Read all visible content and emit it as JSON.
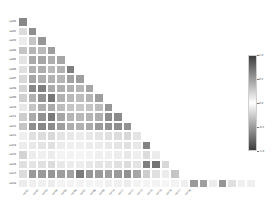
{
  "figure": {
    "background": "#ffffff",
    "plot_background": "#ffffff"
  },
  "chart_data": {
    "type": "heatmap",
    "title": "",
    "subtitle": "",
    "xlabel": "",
    "ylabel": "",
    "grid": false,
    "triangle": "lower",
    "legend_position": "right",
    "cmap": "gray-diverging",
    "vmin": -1.0,
    "vmax": 1.0,
    "colorbar": {
      "label": "",
      "orientation": "vertical",
      "ticks": [
        1.0,
        0.5,
        0.0,
        -0.5,
        -1.0
      ],
      "tick_labels": [
        "1.0",
        "0.5",
        "0.0",
        "-0.5",
        "-1.0"
      ],
      "low_color": "#3d3d3d",
      "mid_color": "#ffffff",
      "high_color": "#3d3d3d"
    },
    "categories": [
      "x01",
      "x02",
      "x03",
      "x04",
      "x05",
      "x06",
      "x07",
      "x08",
      "x09",
      "x10",
      "x11",
      "x12",
      "x13",
      "x14",
      "x15",
      "x16",
      "x17",
      "x18"
    ],
    "xtick_labels": [
      "var01",
      "var02",
      "var03",
      "var04",
      "var05",
      "var06",
      "var07",
      "var08",
      "var09",
      "var10",
      "var11",
      "var12",
      "var13",
      "var14",
      "var15",
      "var16",
      "var17",
      "var18"
    ],
    "ytick_labels": [
      "var01",
      "var02",
      "var03",
      "var04",
      "var05",
      "var06",
      "var07",
      "var08",
      "var09",
      "var10",
      "var11",
      "var12",
      "var13",
      "var14",
      "var15",
      "var16",
      "var17",
      "var18"
    ],
    "matrix": [
      [
        0.62,
        null,
        null,
        null,
        null,
        null,
        null,
        null,
        null,
        null,
        null,
        null,
        null,
        null,
        null,
        null,
        null,
        null
      ],
      [
        0.18,
        0.58,
        null,
        null,
        null,
        null,
        null,
        null,
        null,
        null,
        null,
        null,
        null,
        null,
        null,
        null,
        null,
        null
      ],
      [
        0.1,
        0.3,
        0.54,
        null,
        null,
        null,
        null,
        null,
        null,
        null,
        null,
        null,
        null,
        null,
        null,
        null,
        null,
        null
      ],
      [
        0.3,
        0.38,
        0.36,
        0.5,
        null,
        null,
        null,
        null,
        null,
        null,
        null,
        null,
        null,
        null,
        null,
        null,
        null,
        null
      ],
      [
        0.14,
        0.44,
        0.46,
        0.42,
        0.46,
        null,
        null,
        null,
        null,
        null,
        null,
        null,
        null,
        null,
        null,
        null,
        null,
        null
      ],
      [
        0.16,
        0.4,
        0.42,
        0.36,
        0.4,
        0.66,
        null,
        null,
        null,
        null,
        null,
        null,
        null,
        null,
        null,
        null,
        null,
        null
      ],
      [
        0.2,
        0.46,
        0.42,
        0.4,
        0.38,
        0.48,
        0.5,
        null,
        null,
        null,
        null,
        null,
        null,
        null,
        null,
        null,
        null,
        null
      ],
      [
        0.22,
        0.62,
        0.66,
        0.44,
        0.42,
        0.4,
        0.38,
        0.46,
        null,
        null,
        null,
        null,
        null,
        null,
        null,
        null,
        null,
        null
      ],
      [
        0.24,
        0.4,
        0.56,
        0.7,
        0.4,
        0.36,
        0.34,
        0.38,
        0.5,
        null,
        null,
        null,
        null,
        null,
        null,
        null,
        null,
        null
      ],
      [
        0.12,
        0.3,
        0.42,
        0.44,
        0.34,
        0.3,
        0.28,
        0.3,
        0.34,
        0.54,
        null,
        null,
        null,
        null,
        null,
        null,
        null,
        null
      ],
      [
        0.26,
        0.44,
        0.56,
        0.68,
        0.46,
        0.38,
        0.36,
        0.38,
        0.42,
        0.58,
        0.6,
        null,
        null,
        null,
        null,
        null,
        null,
        null
      ],
      [
        0.3,
        0.58,
        0.62,
        0.6,
        0.5,
        0.42,
        0.4,
        0.44,
        0.52,
        0.56,
        0.58,
        0.56,
        null,
        null,
        null,
        null,
        null,
        null
      ],
      [
        0.08,
        0.16,
        0.18,
        0.2,
        0.14,
        0.12,
        0.1,
        0.12,
        0.14,
        0.16,
        0.18,
        0.2,
        0.14,
        null,
        null,
        null,
        null,
        null
      ],
      [
        0.1,
        0.12,
        0.14,
        0.16,
        0.1,
        0.08,
        0.08,
        0.1,
        0.1,
        0.12,
        0.14,
        0.16,
        0.12,
        0.64,
        null,
        null,
        null,
        null
      ],
      [
        0.22,
        0.1,
        0.08,
        0.1,
        0.06,
        0.06,
        0.05,
        0.06,
        0.08,
        0.08,
        0.1,
        0.12,
        0.08,
        0.18,
        0.1,
        null,
        null,
        null
      ],
      [
        0.16,
        0.14,
        0.16,
        0.18,
        0.12,
        0.1,
        0.1,
        0.12,
        0.14,
        0.14,
        0.16,
        0.18,
        0.14,
        0.66,
        0.72,
        0.2,
        null,
        null
      ],
      [
        0.18,
        0.52,
        0.52,
        0.54,
        0.5,
        0.48,
        0.68,
        0.54,
        0.52,
        0.5,
        0.52,
        0.56,
        0.46,
        0.26,
        0.16,
        0.1,
        0.3,
        null
      ],
      [
        0.1,
        0.08,
        0.08,
        0.1,
        0.06,
        0.06,
        0.06,
        0.06,
        0.06,
        0.08,
        0.08,
        0.1,
        0.06,
        0.06,
        0.06,
        0.05,
        0.06,
        0.08
      ]
    ],
    "last_row_extra": [
      0.52,
      0.5,
      0.1,
      0.54,
      0.16,
      0.08,
      0.08
    ],
    "n_rows": 18,
    "n_cols": 18
  }
}
